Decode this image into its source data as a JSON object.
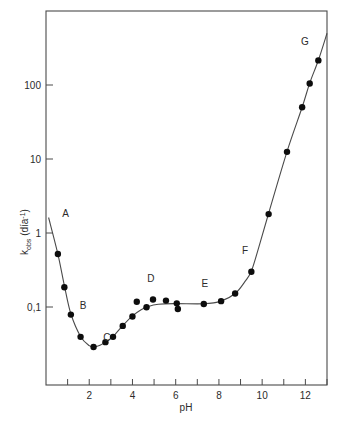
{
  "chart_data": {
    "type": "scatter",
    "title": "",
    "xlabel": "pH",
    "ylabel": "k",
    "ylabel_sub": "obs",
    "ylabel_unit": "(día",
    "ylabel_unit_sup": "-1",
    "ylabel_unit_close": ")",
    "ylabel_full": "k_obs (día-1)",
    "xlim": [
      0,
      13
    ],
    "ylim": [
      0.018,
      560
    ],
    "yscale": "log",
    "xscale": "linear",
    "grid": false,
    "legend": "none",
    "x_major_labels": [
      "2",
      "4",
      "6",
      "8",
      "10",
      "12"
    ],
    "x_major_values": [
      2,
      4,
      6,
      8,
      10,
      12
    ],
    "x_tick_values": [
      1,
      2,
      3,
      4,
      5,
      6,
      7,
      8,
      9,
      10,
      11,
      12,
      13
    ],
    "y_tick_labels": [
      "100",
      "10",
      "1",
      "0,1"
    ],
    "y_tick_values": [
      100,
      10,
      1,
      0.1
    ],
    "decimal_separator": ",",
    "points": [
      {
        "x": 0.55,
        "y": 0.52
      },
      {
        "x": 0.85,
        "y": 0.185
      },
      {
        "x": 1.15,
        "y": 0.079
      },
      {
        "x": 1.6,
        "y": 0.0395
      },
      {
        "x": 2.2,
        "y": 0.0288
      },
      {
        "x": 2.75,
        "y": 0.0335
      },
      {
        "x": 3.1,
        "y": 0.0395
      },
      {
        "x": 3.55,
        "y": 0.0555
      },
      {
        "x": 4.0,
        "y": 0.0745
      },
      {
        "x": 4.2,
        "y": 0.118
      },
      {
        "x": 4.65,
        "y": 0.099
      },
      {
        "x": 4.95,
        "y": 0.126
      },
      {
        "x": 5.55,
        "y": 0.122
      },
      {
        "x": 6.05,
        "y": 0.112
      },
      {
        "x": 6.1,
        "y": 0.094
      },
      {
        "x": 7.3,
        "y": 0.11
      },
      {
        "x": 8.1,
        "y": 0.12
      },
      {
        "x": 8.75,
        "y": 0.152
      },
      {
        "x": 9.5,
        "y": 0.3
      },
      {
        "x": 10.3,
        "y": 1.8
      },
      {
        "x": 11.15,
        "y": 12.5
      },
      {
        "x": 11.85,
        "y": 50
      },
      {
        "x": 12.2,
        "y": 105
      },
      {
        "x": 12.6,
        "y": 215
      }
    ],
    "curve": [
      {
        "x": 0.12,
        "y": 1.62
      },
      {
        "x": 0.55,
        "y": 0.52
      },
      {
        "x": 0.85,
        "y": 0.195
      },
      {
        "x": 1.15,
        "y": 0.081
      },
      {
        "x": 1.6,
        "y": 0.04
      },
      {
        "x": 2.0,
        "y": 0.03
      },
      {
        "x": 2.22,
        "y": 0.0288
      },
      {
        "x": 2.5,
        "y": 0.0305
      },
      {
        "x": 2.78,
        "y": 0.0338
      },
      {
        "x": 3.1,
        "y": 0.0398
      },
      {
        "x": 3.55,
        "y": 0.056
      },
      {
        "x": 4.0,
        "y": 0.076
      },
      {
        "x": 4.4,
        "y": 0.092
      },
      {
        "x": 4.7,
        "y": 0.101
      },
      {
        "x": 5.2,
        "y": 0.109
      },
      {
        "x": 6.0,
        "y": 0.111
      },
      {
        "x": 7.3,
        "y": 0.1105
      },
      {
        "x": 8.1,
        "y": 0.12
      },
      {
        "x": 8.75,
        "y": 0.152
      },
      {
        "x": 9.2,
        "y": 0.22
      },
      {
        "x": 9.5,
        "y": 0.305
      },
      {
        "x": 9.85,
        "y": 0.65
      },
      {
        "x": 10.3,
        "y": 1.85
      },
      {
        "x": 11.15,
        "y": 12.6
      },
      {
        "x": 11.85,
        "y": 50
      },
      {
        "x": 12.2,
        "y": 106
      },
      {
        "x": 12.6,
        "y": 216
      },
      {
        "x": 13.0,
        "y": 500
      }
    ],
    "annotations": [
      {
        "label": "A",
        "x": 0.44,
        "y": 1.55,
        "dx": 10,
        "dy": -2
      },
      {
        "label": "B",
        "x": 1.3,
        "y": 0.105,
        "dx": 9,
        "dy": 4
      },
      {
        "label": "C",
        "x": 2.45,
        "y": 0.033,
        "dx": 8,
        "dy": -2
      },
      {
        "label": "D",
        "x": 4.85,
        "y": 0.175,
        "dx": 0,
        "dy": -7
      },
      {
        "label": "E",
        "x": 7.35,
        "y": 0.155,
        "dx": 0,
        "dy": -6
      },
      {
        "label": "F",
        "x": 9.3,
        "y": 0.43,
        "dx": -2,
        "dy": -6
      },
      {
        "label": "G",
        "x": 12.35,
        "y": 300,
        "dx": -8,
        "dy": -5
      }
    ]
  },
  "axes": {
    "x_title": "pH",
    "y_title_base": "k",
    "y_title_sub": "obs",
    "y_title_unit": "(día",
    "y_title_exp": "-1",
    "y_title_paren": ")"
  }
}
